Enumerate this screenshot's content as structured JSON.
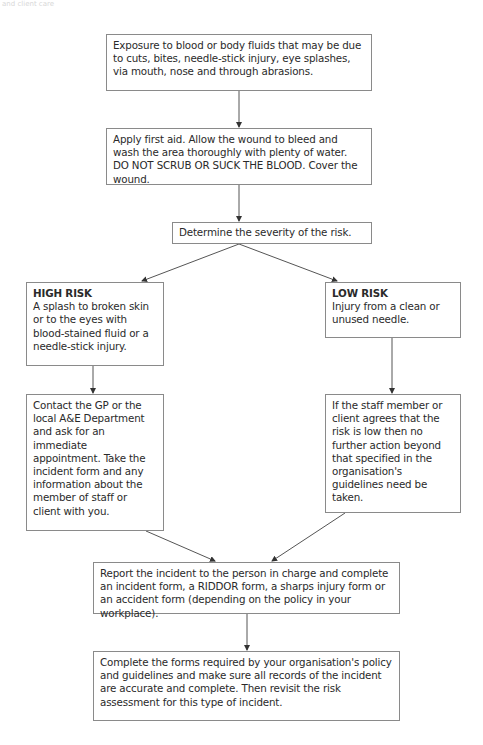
{
  "header": {
    "text": "and client care"
  },
  "flowchart": {
    "exposure": {
      "text": "Exposure to blood or body fluids that may be due to cuts, bites, needle-stick injury, eye splashes, via mouth, nose and through abrasions."
    },
    "first_aid": {
      "text": "Apply first aid. Allow the wound to bleed and wash the area thoroughly with plenty of water. DO NOT SCRUB OR SUCK THE BLOOD. Cover the wound."
    },
    "severity": {
      "text": "Determine the severity of the risk."
    },
    "high_risk": {
      "title": "HIGH RISK",
      "text": "A splash to broken skin or to the eyes with blood-stained fluid or a needle-stick injury."
    },
    "low_risk": {
      "title": "LOW RISK",
      "text": "Injury from a clean or unused needle."
    },
    "high_action": {
      "text": "Contact the GP or the local A&E Department and ask for an immediate appointment. Take the incident form and any information about the member of staff or client with you."
    },
    "low_action": {
      "text": "If the staff member or client agrees that the risk is low then no further action beyond that specified in the organisation's guidelines need be taken."
    },
    "report": {
      "text": "Report the incident to the person in charge and complete an incident form, a RIDDOR form, a sharps injury form or an accident form (depending on the policy in your workplace)."
    },
    "complete": {
      "text": "Complete the forms required by your organisation's policy and guidelines and make sure all records of the incident are accurate and complete. Then revisit the risk assessment for this type of incident."
    }
  },
  "colors": {
    "border": "#8a8a8a",
    "line": "#555555",
    "text": "#2a2a2a"
  }
}
